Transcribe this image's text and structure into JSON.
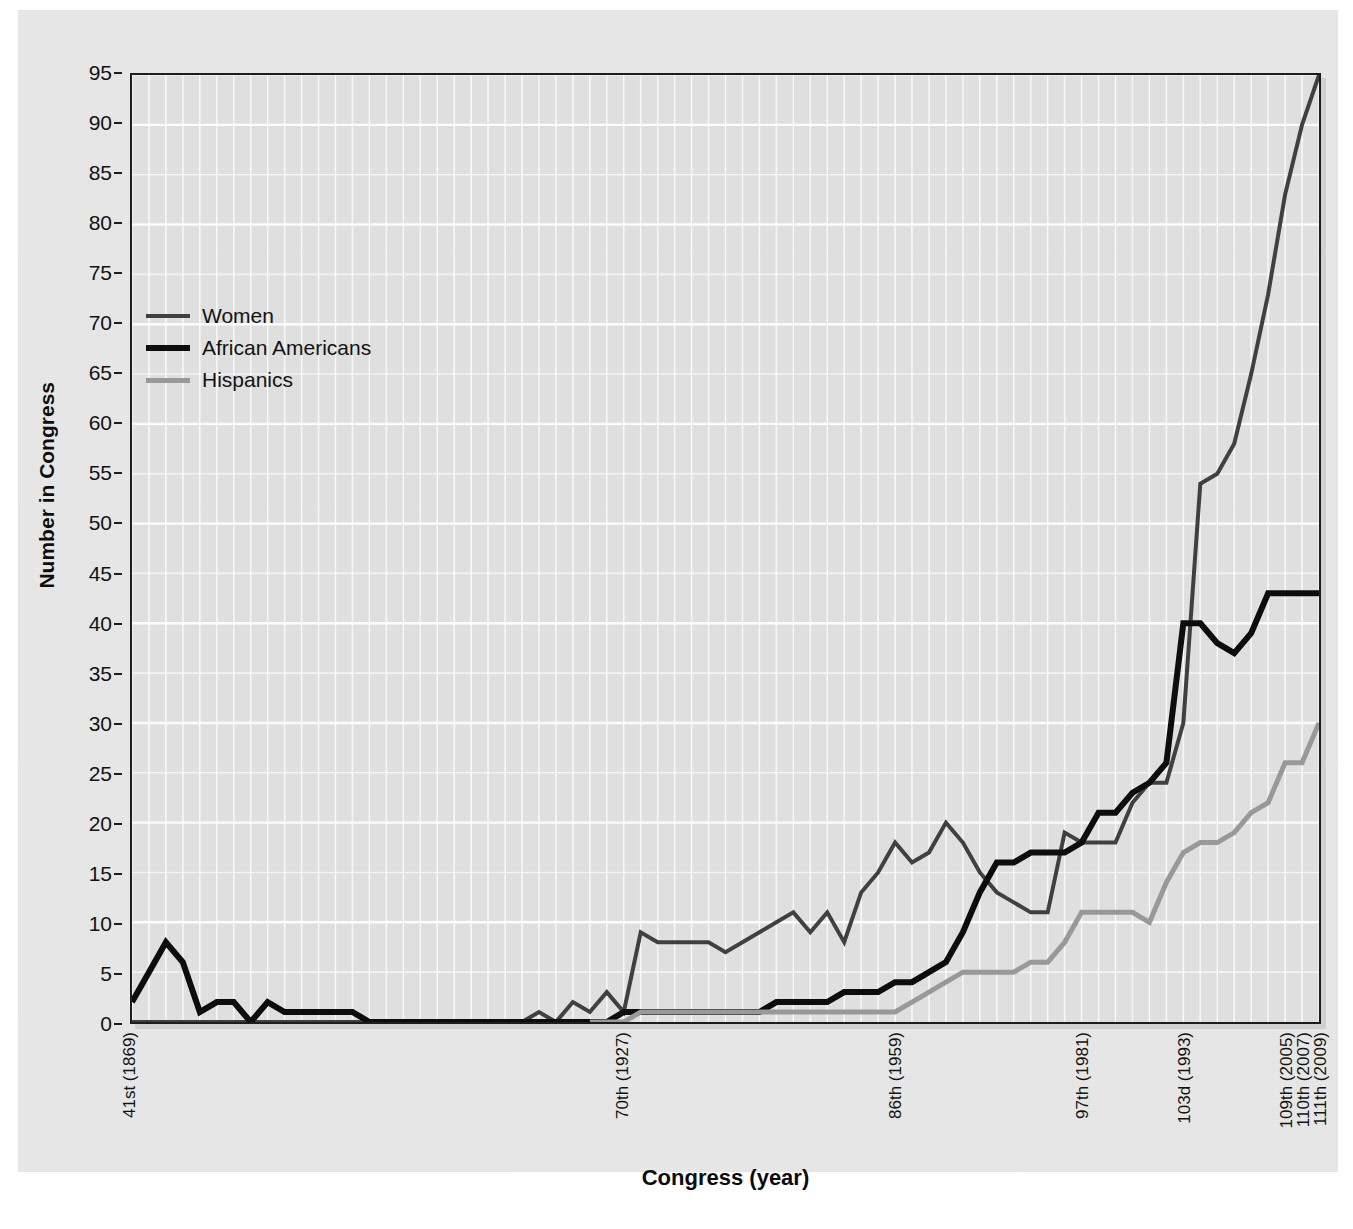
{
  "chart_data": {
    "type": "line",
    "title": "",
    "xlabel": "Congress (year)",
    "ylabel": "Number in Congress",
    "ylim": [
      0,
      95
    ],
    "ytick_step": 5,
    "yticks": [
      0,
      5,
      10,
      15,
      20,
      25,
      30,
      35,
      40,
      45,
      50,
      55,
      60,
      65,
      70,
      75,
      80,
      85,
      90,
      95
    ],
    "grid": true,
    "legend_position": "upper-left-inside",
    "x_index_range": [
      41,
      111
    ],
    "x_tick_labels": [
      {
        "congress": 41,
        "label": "41st (1869)"
      },
      {
        "congress": 70,
        "label": "70th (1927)"
      },
      {
        "congress": 86,
        "label": "86th (1959)"
      },
      {
        "congress": 97,
        "label": "97th (1981)"
      },
      {
        "congress": 103,
        "label": "103d (1993)"
      },
      {
        "congress": 109,
        "label": "109th (2005)"
      },
      {
        "congress": 110,
        "label": "110th (2007)"
      },
      {
        "congress": 111,
        "label": "111th (2009)"
      }
    ],
    "congresses": [
      41,
      42,
      43,
      44,
      45,
      46,
      47,
      48,
      49,
      50,
      51,
      52,
      53,
      54,
      55,
      56,
      57,
      58,
      59,
      60,
      61,
      62,
      63,
      64,
      65,
      66,
      67,
      68,
      69,
      70,
      71,
      72,
      73,
      74,
      75,
      76,
      77,
      78,
      79,
      80,
      81,
      82,
      83,
      84,
      85,
      86,
      87,
      88,
      89,
      90,
      91,
      92,
      73,
      74,
      75,
      76,
      77,
      78,
      79,
      80,
      81,
      82,
      83,
      84,
      85,
      86,
      87,
      88,
      89,
      90,
      91
    ],
    "series": [
      {
        "name": "Women",
        "color": "#3f3f3f",
        "width": 4,
        "x": [
          41,
          42,
          43,
          44,
          45,
          46,
          47,
          48,
          49,
          50,
          51,
          52,
          53,
          54,
          55,
          56,
          57,
          58,
          59,
          60,
          61,
          62,
          63,
          64,
          65,
          66,
          67,
          68,
          69,
          70,
          71,
          72,
          73,
          74,
          75,
          76,
          77,
          78,
          79,
          80,
          81,
          82,
          83,
          84,
          85,
          86,
          87,
          88,
          89,
          90,
          91,
          92,
          93,
          94,
          95,
          96,
          97,
          98,
          99,
          100,
          101,
          102,
          103,
          104,
          105,
          106,
          107,
          108,
          109,
          110,
          111
        ],
        "values": [
          0,
          0,
          0,
          0,
          0,
          0,
          0,
          0,
          0,
          0,
          0,
          0,
          0,
          0,
          0,
          0,
          0,
          0,
          0,
          0,
          0,
          0,
          0,
          0,
          1,
          0,
          2,
          1,
          3,
          1,
          9,
          8,
          8,
          8,
          8,
          7,
          8,
          9,
          10,
          11,
          9,
          11,
          8,
          13,
          15,
          18,
          16,
          17,
          20,
          18,
          15,
          13,
          12,
          11,
          11,
          19,
          18,
          18,
          18,
          22,
          24,
          24,
          30,
          54,
          55,
          58,
          65,
          73,
          83,
          90,
          95
        ]
      },
      {
        "name": "African Americans",
        "color": "#0a0a0a",
        "width": 6,
        "x": [
          41,
          42,
          43,
          44,
          45,
          46,
          47,
          48,
          49,
          50,
          51,
          52,
          53,
          54,
          55,
          56,
          57,
          58,
          59,
          60,
          61,
          62,
          63,
          64,
          65,
          66,
          67,
          68,
          69,
          70,
          71,
          72,
          73,
          74,
          75,
          76,
          77,
          78,
          79,
          80,
          81,
          82,
          83,
          84,
          85,
          86,
          87,
          88,
          89,
          90,
          91,
          92,
          93,
          94,
          95,
          96,
          97,
          98,
          99,
          100,
          101,
          102,
          103,
          104,
          105,
          106,
          107,
          108,
          109,
          110,
          111
        ],
        "values": [
          2,
          5,
          8,
          6,
          1,
          2,
          2,
          0,
          2,
          1,
          1,
          1,
          1,
          1,
          0,
          0,
          0,
          0,
          0,
          0,
          0,
          0,
          0,
          0,
          0,
          0,
          0,
          0,
          0,
          1,
          1,
          1,
          1,
          1,
          1,
          1,
          1,
          1,
          2,
          2,
          2,
          2,
          3,
          3,
          3,
          4,
          4,
          5,
          6,
          9,
          13,
          16,
          16,
          17,
          17,
          17,
          18,
          21,
          21,
          23,
          24,
          26,
          40,
          40,
          38,
          37,
          39,
          43,
          43,
          43,
          43
        ]
      },
      {
        "name": "Hispanics",
        "color": "#9a9a9a",
        "width": 5,
        "x": [
          68,
          69,
          70,
          71,
          72,
          73,
          74,
          75,
          76,
          77,
          78,
          79,
          80,
          81,
          82,
          83,
          84,
          85,
          86,
          87,
          88,
          89,
          90,
          91,
          92,
          93,
          94,
          95,
          96,
          97,
          98,
          99,
          100,
          101,
          102,
          103,
          104,
          105,
          106,
          107,
          108,
          109,
          110,
          111
        ],
        "values": [
          0,
          0,
          0,
          1,
          1,
          1,
          1,
          1,
          1,
          1,
          1,
          1,
          1,
          1,
          1,
          1,
          1,
          1,
          1,
          2,
          3,
          4,
          5,
          5,
          5,
          5,
          6,
          6,
          8,
          11,
          11,
          11,
          11,
          10,
          14,
          17,
          18,
          18,
          19,
          21,
          22,
          26,
          26,
          30
        ]
      }
    ]
  },
  "legend": {
    "items": [
      {
        "label": "Women",
        "color": "#3f3f3f"
      },
      {
        "label": "African Americans",
        "color": "#0a0a0a"
      },
      {
        "label": "Hispanics",
        "color": "#9a9a9a"
      }
    ]
  },
  "axes": {
    "y_title": "Number in Congress",
    "x_title": "Congress (year)"
  },
  "colors": {
    "plot_background": "#e2e2e2",
    "figure_background": "#e9e9e9",
    "gridline": "#ffffff",
    "axis_frame": "#1a1a1a"
  }
}
